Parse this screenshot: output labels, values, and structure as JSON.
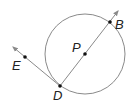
{
  "diagram": {
    "type": "circle-geometry",
    "colors": {
      "circle": "#8a8a8a",
      "line": "#8a8a8a",
      "point": "#111111",
      "label": "#222222"
    },
    "circle": {
      "center_label": "P",
      "cx": 85,
      "cy": 54,
      "r": 40
    },
    "points": [
      {
        "label": "B",
        "x": 110,
        "y": 22
      },
      {
        "label": "P",
        "x": 85,
        "y": 54
      },
      {
        "label": "D",
        "x": 60,
        "y": 86
      },
      {
        "label": "E",
        "x": 25,
        "y": 57
      }
    ],
    "labels": {
      "B": "B",
      "P": "P",
      "D": "D",
      "E": "E"
    },
    "rays": [
      {
        "name": "ray-DB",
        "from": "D",
        "through": "B",
        "note": "secant through center P (diameter line)"
      },
      {
        "name": "ray-DE",
        "from": "D",
        "through": "E",
        "note": "tangent ray at D"
      }
    ]
  }
}
